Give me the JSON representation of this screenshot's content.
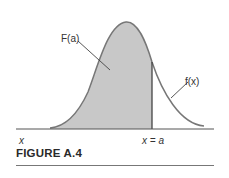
{
  "figure": {
    "caption": "FIGURE A.4",
    "labels": {
      "cdf": "F(a)",
      "pdf": "f(x)",
      "x_axis": "x",
      "cut": "x = a"
    },
    "colors": {
      "curve": "#777777",
      "shade": "#c8c8c8",
      "axis": "#555555",
      "cut_line": "#444444"
    }
  }
}
